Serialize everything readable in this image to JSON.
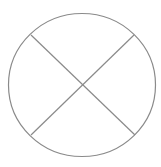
{
  "diagram": {
    "type": "circle-with-cross",
    "stroke_color": "#8a8a8a",
    "background": "#ffffff",
    "circle": {
      "cx": 82,
      "cy": 85,
      "rx": 73.5,
      "ry": 71.5
    },
    "lines": [
      {
        "name": "diagonal-descending",
        "x1": 31,
        "y1": 35,
        "x2": 135,
        "y2": 135
      },
      {
        "name": "diagonal-ascending",
        "x1": 134,
        "y1": 35,
        "x2": 31,
        "y2": 135
      }
    ]
  }
}
